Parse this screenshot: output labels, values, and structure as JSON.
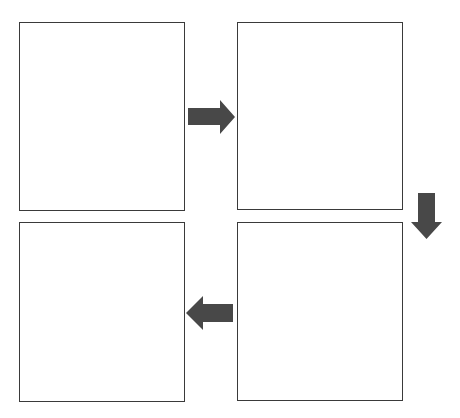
{
  "diagram": {
    "type": "four-step cycle flow",
    "colors": {
      "box_border": "#3a3a3a",
      "arrow_fill": "#484848",
      "background": "#ffffff"
    },
    "boxes": [
      {
        "id": "step-1",
        "position": "top-left",
        "label": ""
      },
      {
        "id": "step-2",
        "position": "top-right",
        "label": ""
      },
      {
        "id": "step-3",
        "position": "bottom-right",
        "label": ""
      },
      {
        "id": "step-4",
        "position": "bottom-left",
        "label": ""
      }
    ],
    "arrows": [
      {
        "from": "step-1",
        "to": "step-2",
        "direction": "right"
      },
      {
        "from": "step-2",
        "to": "step-3",
        "direction": "down"
      },
      {
        "from": "step-3",
        "to": "step-4",
        "direction": "left"
      }
    ]
  }
}
